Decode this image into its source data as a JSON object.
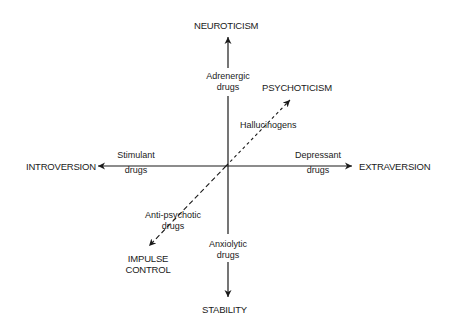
{
  "axes": {
    "top": "NEUROTICISM",
    "bottom": "STABILITY",
    "left": "INTROVERSION",
    "right": "EXTRAVERSION",
    "diag_top": "PSYCHOTICISM",
    "diag_bottom_line1": "IMPULSE",
    "diag_bottom_line2": "CONTROL"
  },
  "drugs": {
    "adrenergic_1": "Adrenergic",
    "adrenergic_2": "drugs",
    "stimulant_1": "Stimulant",
    "stimulant_2": "drugs",
    "depressant_1": "Depressant",
    "depressant_2": "drugs",
    "anxiolytic_1": "Anxiolytic",
    "anxiolytic_2": "drugs",
    "hallucinogens": "Hallucinogens",
    "antipsychotic_1": "Anti-psychotic",
    "antipsychotic_2": "drugs"
  },
  "colors": {
    "ink": "#1a1a1a",
    "background": "#ffffff"
  }
}
